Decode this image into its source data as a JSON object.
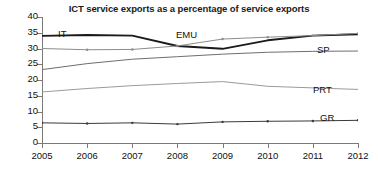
{
  "chart_data": {
    "type": "line",
    "title": "ICT service exports as a percentage of service exports",
    "xlabel": "",
    "ylabel": "",
    "x": [
      2005,
      2006,
      2007,
      2008,
      2009,
      2010,
      2011,
      2012
    ],
    "categories": [
      "2005",
      "2006",
      "2007",
      "2008",
      "2009",
      "2010",
      "2011",
      "2012"
    ],
    "xlim": [
      2005,
      2012
    ],
    "ylim": [
      0,
      40
    ],
    "yticks": [
      0,
      5,
      10,
      15,
      20,
      25,
      30,
      35,
      40
    ],
    "ytick_labels": [
      "0",
      "5",
      "10",
      "15",
      "20",
      "25",
      "30",
      "35",
      "40"
    ],
    "grid": false,
    "legend": "inline-labels",
    "series": [
      {
        "name": "IT",
        "color": "#1a1a1a",
        "width": 1.9,
        "markers": false,
        "values": [
          34.0,
          34.3,
          34.1,
          30.8,
          29.9,
          32.6,
          34.1,
          34.5
        ]
      },
      {
        "name": "EMU",
        "color": "#8c8c8c",
        "width": 1.0,
        "markers": true,
        "values": [
          30.0,
          29.6,
          29.7,
          30.8,
          33.0,
          33.6,
          34.1,
          34.8
        ]
      },
      {
        "name": "SP",
        "color": "#6e6e6e",
        "width": 1.0,
        "markers": false,
        "values": [
          23.3,
          25.2,
          26.6,
          27.4,
          28.2,
          28.8,
          29.1,
          29.2
        ]
      },
      {
        "name": "PRT",
        "color": "#9a9a9a",
        "width": 1.0,
        "markers": false,
        "values": [
          16.2,
          17.3,
          18.2,
          18.9,
          19.5,
          18.0,
          17.5,
          17.0
        ]
      },
      {
        "name": "GR",
        "color": "#3a3a3a",
        "width": 1.0,
        "markers": true,
        "values": [
          6.4,
          6.2,
          6.4,
          6.0,
          6.7,
          6.9,
          7.0,
          7.2
        ]
      }
    ],
    "annotations": [
      {
        "text": "IT",
        "x_px": 58,
        "y_px": 28
      },
      {
        "text": "EMU",
        "x_px": 176,
        "y_px": 29
      },
      {
        "text": "SP",
        "x_px": 317,
        "y_px": 44
      },
      {
        "text": "PRT",
        "x_px": 313,
        "y_px": 84
      },
      {
        "text": "GR",
        "x_px": 320,
        "y_px": 112
      }
    ]
  }
}
